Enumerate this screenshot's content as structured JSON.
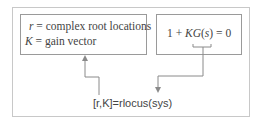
{
  "diagram": {
    "left_box": {
      "line1": {
        "var": "r",
        "text": " = complex root locations"
      },
      "line2": {
        "var": "K",
        "text": " = gain vector"
      }
    },
    "right_box": {
      "pre": "1 + ",
      "kg": "KG",
      "paren_open": "(",
      "s": "s",
      "post": ") = 0"
    },
    "command": "[r,K]=rlocus(sys)",
    "colors": {
      "line": "#8a8a8a",
      "text": "#444444",
      "frame": "#c8c8c8"
    }
  }
}
